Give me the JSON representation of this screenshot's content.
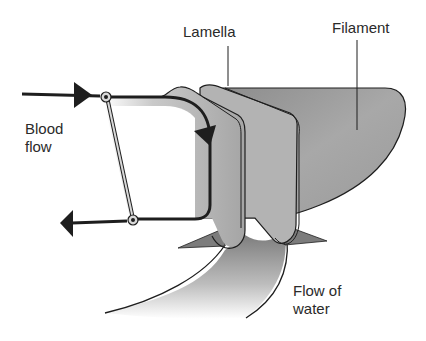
{
  "diagram": {
    "type": "anatomical-illustration",
    "labels": {
      "lamella": "Lamella",
      "filament": "Filament",
      "blood_flow_line1": "Blood",
      "blood_flow_line2": "flow",
      "water_flow_line1": "Flow of",
      "water_flow_line2": "water"
    },
    "arrows": [
      {
        "name": "blood-in-arrow",
        "direction": "right"
      },
      {
        "name": "blood-circulation-arrow",
        "direction": "down"
      },
      {
        "name": "blood-out-arrow",
        "direction": "left"
      }
    ],
    "colors": {
      "filament_fill": "#9a9a9a",
      "lamella_fill": "#b8b8b8",
      "outline": "#1e1e1e",
      "water_flow_fill": "#8a8a8a",
      "text": "#2a2a2a"
    }
  }
}
